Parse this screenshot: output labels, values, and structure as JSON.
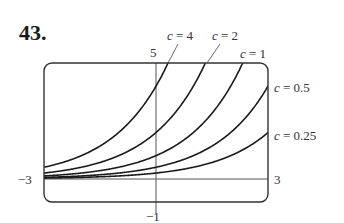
{
  "problem_number": "43.",
  "chart_data": {
    "type": "line",
    "title": "",
    "function": "y = c * 2^x",
    "xlabel": "",
    "ylabel": "",
    "xlim": [
      -3,
      3
    ],
    "ylim": [
      -1,
      5
    ],
    "grid": false,
    "legend_position": "inline labels",
    "tick_labels": {
      "x_min": "−3",
      "x_max": "3",
      "y_min": "−1",
      "y_max": "5"
    },
    "series": [
      {
        "name": "c = 4",
        "c": 4
      },
      {
        "name": "c = 2",
        "c": 2
      },
      {
        "name": "c = 1",
        "c": 1
      },
      {
        "name": "c = 0.5",
        "c": 0.5
      },
      {
        "name": "c = 0.25",
        "c": 0.25
      }
    ],
    "x": [
      -3,
      -2,
      -1,
      0,
      1,
      2,
      3
    ],
    "series_values": {
      "c = 4": [
        0.5,
        1,
        2,
        4,
        8,
        16,
        32
      ],
      "c = 2": [
        0.25,
        0.5,
        1,
        2,
        4,
        8,
        16
      ],
      "c = 1": [
        0.125,
        0.25,
        0.5,
        1,
        2,
        4,
        8
      ],
      "c = 0.5": [
        0.0625,
        0.125,
        0.25,
        0.5,
        1,
        2,
        4
      ],
      "c = 0.25": [
        0.03125,
        0.0625,
        0.125,
        0.25,
        0.5,
        1,
        2
      ]
    }
  },
  "labels": {
    "c4": {
      "var": "c",
      "eq": " = 4"
    },
    "c2": {
      "var": "c",
      "eq": " = 2"
    },
    "c1": {
      "var": "c",
      "eq": " = 1"
    },
    "c05": {
      "var": "c",
      "eq": " = 0.5"
    },
    "c025": {
      "var": "c",
      "eq": " = 0.25"
    }
  },
  "colors": {
    "curve": "#1a1a1a",
    "frame": "#333333",
    "axis": "#555555"
  }
}
